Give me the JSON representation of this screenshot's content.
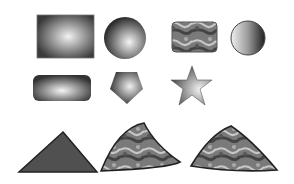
{
  "shapes": [
    {
      "id": "rect-radial",
      "kind": "rectangle",
      "fill": "radial-gradient",
      "colors": [
        "#f2f2f2",
        "#3a3a3a"
      ]
    },
    {
      "id": "circle-radial",
      "kind": "circle",
      "fill": "radial-gradient",
      "colors": [
        "#f5f5f5",
        "#2c2c2c"
      ]
    },
    {
      "id": "rounded-rect-texture",
      "kind": "rounded-rectangle",
      "fill": "texture",
      "colors": [
        "#9a9a9a",
        "#4a4a4a",
        "#d0d0d0"
      ]
    },
    {
      "id": "circle-linear",
      "kind": "circle",
      "fill": "linear-gradient",
      "colors": [
        "#f0f0f0",
        "#1e1e1e"
      ]
    },
    {
      "id": "rounded-rect-radial",
      "kind": "rounded-rectangle",
      "fill": "radial-gradient",
      "colors": [
        "#f5f5f5",
        "#333333"
      ]
    },
    {
      "id": "pentagon-radial",
      "kind": "pentagon",
      "fill": "radial-gradient",
      "colors": [
        "#f0f0f0",
        "#3a3a3a"
      ]
    },
    {
      "id": "star-gradient",
      "kind": "star",
      "fill": "radial-gradient",
      "colors": [
        "#f2f2f2",
        "#4a4a4a"
      ]
    },
    {
      "id": "triangle-solid",
      "kind": "triangle",
      "fill": "solid",
      "colors": [
        "#505050"
      ]
    },
    {
      "id": "curved-triangle-texture",
      "kind": "curved-triangle",
      "fill": "texture",
      "colors": [
        "#8a8a8a",
        "#3f3f3f",
        "#cfcfcf"
      ]
    },
    {
      "id": "curved-triangle-texture-2",
      "kind": "curved-triangle",
      "fill": "texture",
      "colors": [
        "#7d7d7d",
        "#3a3a3a",
        "#c8c8c8"
      ]
    }
  ]
}
